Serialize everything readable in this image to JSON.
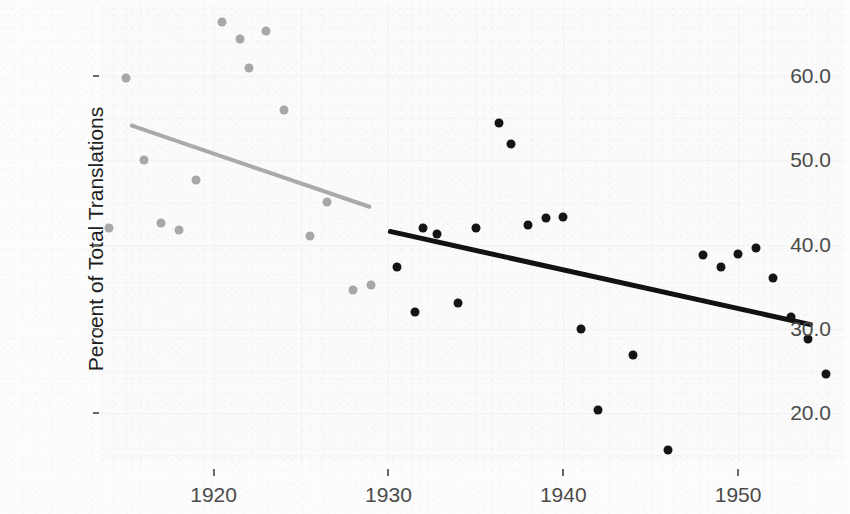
{
  "chart_data": {
    "type": "scatter",
    "title": "",
    "xlabel": "",
    "ylabel": "Percent of Total Translations",
    "xlim": [
      1913.5,
      1956.0
    ],
    "ylim": [
      14.0,
      68.5
    ],
    "xticks": [
      1920,
      1930,
      1940,
      1950
    ],
    "xtick_labels": [
      "1920",
      "1930",
      "1940",
      "1950"
    ],
    "yticks": [
      20.0,
      30.0,
      40.0,
      50.0,
      60.0
    ],
    "ytick_labels": [
      "20.0",
      "30.0",
      "40.0",
      "50.0",
      "60.0"
    ],
    "grid": true,
    "legend": "none",
    "colors": {
      "early_points": "#a8a8a8",
      "late_points": "#141414",
      "early_trend": "#aaaaaa",
      "late_trend": "#111111",
      "panel_background": "#fbfbfb",
      "gridline": "#f2f2f2",
      "axis_text": "#4a4a4a",
      "label_text": "#1d1d1d"
    },
    "series": [
      {
        "name": "early-period",
        "color": "#a8a8a8",
        "points": [
          {
            "x": 1914.0,
            "y": 42.0
          },
          {
            "x": 1915.0,
            "y": 59.8
          },
          {
            "x": 1916.0,
            "y": 50.0
          },
          {
            "x": 1917.0,
            "y": 42.5
          },
          {
            "x": 1918.0,
            "y": 41.7
          },
          {
            "x": 1919.0,
            "y": 47.7
          },
          {
            "x": 1920.5,
            "y": 66.5
          },
          {
            "x": 1921.5,
            "y": 64.5
          },
          {
            "x": 1922.0,
            "y": 61.0
          },
          {
            "x": 1923.0,
            "y": 65.4
          },
          {
            "x": 1924.0,
            "y": 56.0
          },
          {
            "x": 1925.5,
            "y": 41.0
          },
          {
            "x": 1926.5,
            "y": 45.0
          },
          {
            "x": 1928.0,
            "y": 34.6
          },
          {
            "x": 1929.0,
            "y": 35.2
          }
        ]
      },
      {
        "name": "late-period",
        "color": "#141414",
        "points": [
          {
            "x": 1930.5,
            "y": 37.3
          },
          {
            "x": 1931.5,
            "y": 32.0
          },
          {
            "x": 1932.0,
            "y": 42.0
          },
          {
            "x": 1932.8,
            "y": 41.3
          },
          {
            "x": 1934.0,
            "y": 33.0
          },
          {
            "x": 1935.0,
            "y": 42.0
          },
          {
            "x": 1936.3,
            "y": 54.5
          },
          {
            "x": 1937.0,
            "y": 52.0
          },
          {
            "x": 1938.0,
            "y": 42.3
          },
          {
            "x": 1939.0,
            "y": 43.2
          },
          {
            "x": 1940.0,
            "y": 43.3
          },
          {
            "x": 1941.0,
            "y": 30.0
          },
          {
            "x": 1942.0,
            "y": 20.3
          },
          {
            "x": 1944.0,
            "y": 26.8
          },
          {
            "x": 1946.0,
            "y": 15.6
          },
          {
            "x": 1948.0,
            "y": 38.7
          },
          {
            "x": 1949.0,
            "y": 37.3
          },
          {
            "x": 1950.0,
            "y": 38.9
          },
          {
            "x": 1951.0,
            "y": 39.6
          },
          {
            "x": 1952.0,
            "y": 36.0
          },
          {
            "x": 1953.0,
            "y": 31.4
          },
          {
            "x": 1954.0,
            "y": 28.8
          },
          {
            "x": 1955.0,
            "y": 24.6
          }
        ]
      }
    ],
    "trend_lines": [
      {
        "name": "early-trend-line",
        "color": "#aaaaaa",
        "x_start": 1915.2,
        "y_start": 54.2,
        "x_end": 1929.0,
        "y_end": 44.4
      },
      {
        "name": "late-trend-line",
        "color": "#111111",
        "x_start": 1930.0,
        "y_start": 41.6,
        "x_end": 1954.3,
        "y_end": 30.4
      }
    ]
  }
}
